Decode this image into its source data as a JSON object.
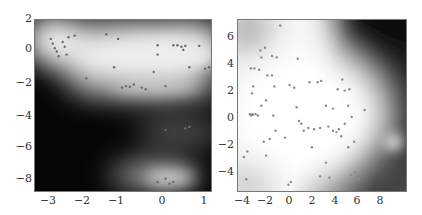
{
  "chart_data": [
    {
      "type": "heatmap",
      "title": "",
      "xlabel": "",
      "ylabel": "",
      "xlim": [
        -3.3,
        1.2
      ],
      "ylim": [
        -9,
        2
      ],
      "xticks": [
        "-3",
        "-2",
        "-1",
        "0",
        "1"
      ],
      "yticks": [
        "2",
        "0",
        "-2",
        "-4",
        "-6",
        "-8"
      ],
      "grid": false,
      "colormap": "grayscale (black = low density, white = high density)",
      "density_modes": [
        {
          "x": -0.6,
          "y": 0.0,
          "note": "broad upper bright band"
        },
        {
          "x": -0.5,
          "y": -2.2,
          "note": "bright ridge"
        },
        {
          "x": 0.6,
          "y": -4.8,
          "note": "faint band"
        },
        {
          "x": 0.1,
          "y": -8.3,
          "note": "bright blob at bottom"
        }
      ],
      "scatter_points": [
        [
          -2.9,
          0.8
        ],
        [
          -2.85,
          0.5
        ],
        [
          -2.8,
          0.2
        ],
        [
          -2.75,
          0.0
        ],
        [
          -2.7,
          -0.3
        ],
        [
          -2.6,
          0.6
        ],
        [
          -2.55,
          0.3
        ],
        [
          -2.5,
          -0.2
        ],
        [
          -2.45,
          0.9
        ],
        [
          -2.3,
          1.0
        ],
        [
          -1.5,
          1.1
        ],
        [
          -1.2,
          0.8
        ],
        [
          -2.0,
          -1.7
        ],
        [
          -1.3,
          -1.0
        ],
        [
          -1.1,
          -2.3
        ],
        [
          -1.0,
          -2.2
        ],
        [
          -0.9,
          -2.25
        ],
        [
          -0.8,
          -2.1
        ],
        [
          -0.6,
          -2.3
        ],
        [
          -0.5,
          -2.4
        ],
        [
          -0.3,
          -1.3
        ],
        [
          -0.2,
          -0.2
        ],
        [
          0.0,
          -2.2
        ],
        [
          -0.2,
          0.4
        ],
        [
          0.2,
          0.4
        ],
        [
          0.3,
          0.4
        ],
        [
          0.4,
          0.3
        ],
        [
          0.45,
          0.1
        ],
        [
          0.5,
          0.35
        ],
        [
          0.85,
          0.35
        ],
        [
          1.0,
          -1.1
        ],
        [
          1.1,
          -1.0
        ],
        [
          0.6,
          -1.0
        ],
        [
          0.5,
          -4.9
        ],
        [
          0.6,
          -4.8
        ],
        [
          0.0,
          -5.0
        ],
        [
          -0.2,
          -8.3
        ],
        [
          0.0,
          -8.1
        ],
        [
          0.1,
          -8.4
        ],
        [
          0.2,
          -8.3
        ]
      ]
    },
    {
      "type": "heatmap",
      "title": "",
      "xlabel": "",
      "ylabel": "",
      "xlim": [
        -4.5,
        10
      ],
      "ylim": [
        -5.5,
        7
      ],
      "xticks": [
        "-4",
        "-2",
        "0",
        "2",
        "4",
        "6",
        "8"
      ],
      "yticks": [
        "6",
        "4",
        "2",
        "0",
        "-2",
        "-4"
      ],
      "grid": false,
      "colormap": "grayscale (black = low density, white = high density)",
      "density_modes": [
        {
          "x": 1.5,
          "y": 0.5,
          "note": "large bright central region"
        },
        {
          "x": 9.3,
          "y": -2.7,
          "note": "small bright spot right"
        },
        {
          "x": 9.0,
          "y": 6.5,
          "note": "dark upper-right corner"
        }
      ],
      "scatter_points": [
        [
          -3.5,
          0.2
        ],
        [
          -3.4,
          0.1
        ],
        [
          -3.3,
          0.2
        ],
        [
          -3.2,
          0.15
        ],
        [
          -3.0,
          0.2
        ],
        [
          -2.8,
          0.1
        ],
        [
          -3.2,
          2.2
        ],
        [
          -3.3,
          1.7
        ],
        [
          -3.4,
          3.5
        ],
        [
          -3.1,
          3.5
        ],
        [
          -2.7,
          3.4
        ],
        [
          -2.6,
          4.8
        ],
        [
          -2.2,
          5.0
        ],
        [
          -2.5,
          4.3
        ],
        [
          -1.6,
          4.4
        ],
        [
          -1.2,
          4.3
        ],
        [
          -0.9,
          6.6
        ],
        [
          -2.0,
          3.0
        ],
        [
          -1.6,
          3.0
        ],
        [
          -1.4,
          2.2
        ],
        [
          -2.5,
          0.8
        ],
        [
          -2.1,
          1.2
        ],
        [
          -1.5,
          0.1
        ],
        [
          -1.3,
          -1.0
        ],
        [
          -1.8,
          -1.6
        ],
        [
          -2.3,
          -1.8
        ],
        [
          -2.1,
          -2.8
        ],
        [
          -3.7,
          -2.5
        ],
        [
          -4.0,
          -2.9
        ],
        [
          -3.8,
          -4.5
        ],
        [
          -0.1,
          2.3
        ],
        [
          0.3,
          2.1
        ],
        [
          0.6,
          4.2
        ],
        [
          0.5,
          0.7
        ],
        [
          0.7,
          -0.3
        ],
        [
          0.9,
          -0.5
        ],
        [
          1.1,
          -1.0
        ],
        [
          1.5,
          -0.8
        ],
        [
          2.0,
          -0.9
        ],
        [
          2.5,
          -0.8
        ],
        [
          2.3,
          2.5
        ],
        [
          2.6,
          2.6
        ],
        [
          3.0,
          0.8
        ],
        [
          3.2,
          -0.7
        ],
        [
          3.6,
          -1.0
        ],
        [
          3.9,
          -1.1
        ],
        [
          4.1,
          -0.9
        ],
        [
          4.3,
          -1.4
        ],
        [
          4.6,
          -0.5
        ],
        [
          4.9,
          -2.2
        ],
        [
          4.0,
          2.0
        ],
        [
          4.6,
          1.9
        ],
        [
          5.0,
          2.0
        ],
        [
          4.9,
          0.8
        ],
        [
          5.2,
          0.0
        ],
        [
          5.4,
          -1.8
        ],
        [
          6.3,
          0.5
        ],
        [
          5.1,
          -4.2
        ],
        [
          5.5,
          -4.0
        ],
        [
          5.8,
          -4.5
        ],
        [
          2.5,
          -4.3
        ],
        [
          3.3,
          -4.4
        ],
        [
          3.0,
          -3.3
        ],
        [
          0.0,
          -4.7
        ],
        [
          -0.2,
          -4.9
        ],
        [
          1.6,
          2.5
        ],
        [
          3.6,
          0.6
        ],
        [
          4.4,
          2.7
        ],
        [
          -0.5,
          -1.5
        ],
        [
          1.8,
          -2.2
        ]
      ]
    }
  ]
}
